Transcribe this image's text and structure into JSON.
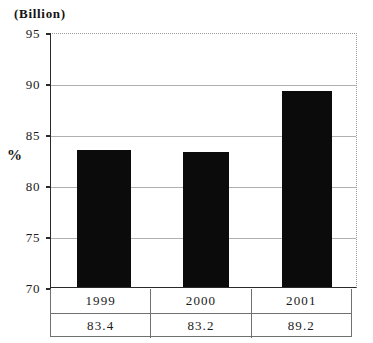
{
  "unit_caption": "(Billion)",
  "percent_label": "%",
  "chart_data": {
    "type": "bar",
    "title": "",
    "subtitle": "",
    "xlabel": "",
    "ylabel": "%",
    "unit_note": "(Billion)",
    "categories": [
      "1999",
      "2000",
      "2001"
    ],
    "values": [
      83.4,
      83.2,
      89.2
    ],
    "value_labels": [
      "83.4",
      "83.2",
      "89.2"
    ],
    "ylim": [
      70,
      95
    ],
    "ytick_values": [
      95,
      90,
      85,
      80,
      75,
      70
    ],
    "ytick_labels": [
      "95",
      "90",
      "85",
      "80",
      "75",
      "70"
    ],
    "grid": true,
    "grid_axis": "y",
    "legend": false,
    "legend_position": "none",
    "bar_color": "#0b0b0b",
    "gridline_color": "#b0b0b0",
    "axis_color": "#2a2a2a"
  },
  "table": {
    "row_years": [
      "1999",
      "2000",
      "2001"
    ],
    "row_values": [
      "83.4",
      "83.2",
      "89.2"
    ]
  }
}
